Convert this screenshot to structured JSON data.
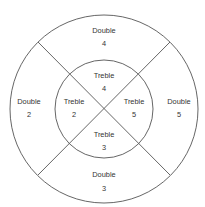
{
  "diagram": {
    "outer_ring": [
      {
        "position": "top",
        "label": "Double",
        "value": "4"
      },
      {
        "position": "left",
        "label": "Double",
        "value": "2"
      },
      {
        "position": "right",
        "label": "Double",
        "value": "5"
      },
      {
        "position": "bottom",
        "label": "Double",
        "value": "3"
      }
    ],
    "inner_circle": [
      {
        "position": "top",
        "label": "Treble",
        "value": "4"
      },
      {
        "position": "left",
        "label": "Treble",
        "value": "2"
      },
      {
        "position": "right",
        "label": "Treble",
        "value": "5"
      },
      {
        "position": "bottom",
        "label": "Treble",
        "value": "3"
      }
    ],
    "colors": {
      "stroke": "#555555",
      "text": "#333333",
      "background": "#ffffff"
    }
  }
}
